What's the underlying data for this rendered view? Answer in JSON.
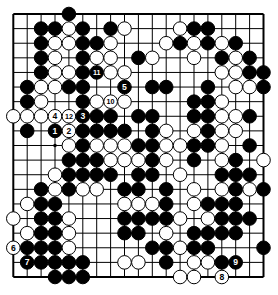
{
  "diagram": {
    "type": "go-board",
    "board_size": 19,
    "colors": {
      "background": "#ffffff",
      "line": "#000000",
      "black_stone": "#000000",
      "white_stone": "#ffffff",
      "black_stone_label": "#ffffff",
      "white_stone_label": "#000000"
    },
    "geometry": {
      "width": 278,
      "height": 295,
      "left": 13.3,
      "top": 14,
      "col_step": 13.9,
      "row_step": 14.611,
      "stone_radius": 6.8
    },
    "star_points": [
      [
        4,
        4
      ],
      [
        10,
        4
      ],
      [
        16,
        4
      ],
      [
        4,
        10
      ],
      [
        10,
        10
      ],
      [
        16,
        10
      ],
      [
        4,
        16
      ],
      [
        10,
        16
      ],
      [
        16,
        16
      ]
    ],
    "stones": [
      [
        5,
        1,
        "b"
      ],
      [
        3,
        2,
        "b"
      ],
      [
        4,
        2,
        "b"
      ],
      [
        5,
        2,
        "w"
      ],
      [
        6,
        2,
        "b"
      ],
      [
        8,
        2,
        "b"
      ],
      [
        9,
        2,
        "w"
      ],
      [
        13,
        2,
        "w"
      ],
      [
        14,
        2,
        "b"
      ],
      [
        15,
        2,
        "b"
      ],
      [
        3,
        3,
        "b"
      ],
      [
        4,
        3,
        "w"
      ],
      [
        5,
        3,
        "w"
      ],
      [
        6,
        3,
        "b"
      ],
      [
        7,
        3,
        "b"
      ],
      [
        8,
        3,
        "w"
      ],
      [
        12,
        3,
        "w"
      ],
      [
        13,
        3,
        "b"
      ],
      [
        14,
        3,
        "w"
      ],
      [
        15,
        3,
        "b"
      ],
      [
        16,
        3,
        "w"
      ],
      [
        17,
        3,
        "b"
      ],
      [
        3,
        4,
        "b"
      ],
      [
        4,
        4,
        "w"
      ],
      [
        6,
        4,
        "b"
      ],
      [
        7,
        4,
        "w"
      ],
      [
        8,
        4,
        "w"
      ],
      [
        10,
        4,
        "b"
      ],
      [
        11,
        4,
        "w"
      ],
      [
        14,
        4,
        "w"
      ],
      [
        16,
        4,
        "b"
      ],
      [
        17,
        4,
        "w"
      ],
      [
        18,
        4,
        "b"
      ],
      [
        3,
        5,
        "b"
      ],
      [
        4,
        5,
        "w"
      ],
      [
        5,
        5,
        "w"
      ],
      [
        6,
        5,
        "b"
      ],
      [
        7,
        5,
        "b",
        11
      ],
      [
        8,
        5,
        "w"
      ],
      [
        9,
        5,
        "w"
      ],
      [
        16,
        5,
        "w"
      ],
      [
        17,
        5,
        "w"
      ],
      [
        18,
        5,
        "b"
      ],
      [
        19,
        5,
        "b"
      ],
      [
        2,
        6,
        "b"
      ],
      [
        3,
        6,
        "w"
      ],
      [
        4,
        6,
        "w"
      ],
      [
        5,
        6,
        "b"
      ],
      [
        6,
        6,
        "b"
      ],
      [
        9,
        6,
        "b",
        5
      ],
      [
        11,
        6,
        "b"
      ],
      [
        12,
        6,
        "b"
      ],
      [
        15,
        6,
        "b"
      ],
      [
        17,
        6,
        "w"
      ],
      [
        18,
        6,
        "w"
      ],
      [
        19,
        6,
        "b"
      ],
      [
        2,
        7,
        "b"
      ],
      [
        3,
        7,
        "w"
      ],
      [
        6,
        7,
        "b"
      ],
      [
        7,
        7,
        "w"
      ],
      [
        8,
        7,
        "w",
        10
      ],
      [
        9,
        7,
        "w"
      ],
      [
        14,
        7,
        "b"
      ],
      [
        15,
        7,
        "b"
      ],
      [
        16,
        7,
        "w"
      ],
      [
        1,
        8,
        "w"
      ],
      [
        2,
        8,
        "w"
      ],
      [
        3,
        8,
        "w"
      ],
      [
        4,
        8,
        "w",
        4
      ],
      [
        5,
        8,
        "w",
        12
      ],
      [
        6,
        8,
        "b",
        3
      ],
      [
        7,
        8,
        "b"
      ],
      [
        8,
        8,
        "b"
      ],
      [
        10,
        8,
        "b"
      ],
      [
        11,
        8,
        "b"
      ],
      [
        14,
        8,
        "b"
      ],
      [
        15,
        8,
        "b"
      ],
      [
        16,
        8,
        "w"
      ],
      [
        17,
        8,
        "w"
      ],
      [
        18,
        8,
        "b"
      ],
      [
        2,
        9,
        "b"
      ],
      [
        4,
        9,
        "b",
        1
      ],
      [
        5,
        9,
        "w",
        2
      ],
      [
        6,
        9,
        "b"
      ],
      [
        7,
        9,
        "b"
      ],
      [
        8,
        9,
        "b"
      ],
      [
        9,
        9,
        "b"
      ],
      [
        11,
        9,
        "b"
      ],
      [
        12,
        9,
        "w"
      ],
      [
        14,
        9,
        "w"
      ],
      [
        15,
        9,
        "b"
      ],
      [
        16,
        9,
        "w"
      ],
      [
        17,
        9,
        "w"
      ],
      [
        5,
        10,
        "w"
      ],
      [
        6,
        10,
        "b"
      ],
      [
        7,
        10,
        "w"
      ],
      [
        8,
        10,
        "w"
      ],
      [
        9,
        10,
        "w"
      ],
      [
        10,
        10,
        "b"
      ],
      [
        11,
        10,
        "b"
      ],
      [
        12,
        10,
        "w"
      ],
      [
        13,
        10,
        "w"
      ],
      [
        14,
        10,
        "b"
      ],
      [
        15,
        10,
        "b"
      ],
      [
        16,
        10,
        "w"
      ],
      [
        18,
        10,
        "b"
      ],
      [
        5,
        11,
        "b"
      ],
      [
        6,
        11,
        "b"
      ],
      [
        7,
        11,
        "b"
      ],
      [
        8,
        11,
        "w"
      ],
      [
        9,
        11,
        "w"
      ],
      [
        10,
        11,
        "w"
      ],
      [
        11,
        11,
        "b"
      ],
      [
        12,
        11,
        "w"
      ],
      [
        14,
        11,
        "b"
      ],
      [
        16,
        11,
        "w"
      ],
      [
        17,
        11,
        "b"
      ],
      [
        19,
        11,
        "w"
      ],
      [
        4,
        12,
        "w"
      ],
      [
        5,
        12,
        "b"
      ],
      [
        6,
        12,
        "b"
      ],
      [
        7,
        12,
        "b"
      ],
      [
        8,
        12,
        "b"
      ],
      [
        10,
        12,
        "b"
      ],
      [
        11,
        12,
        "b"
      ],
      [
        13,
        12,
        "w"
      ],
      [
        16,
        12,
        "b"
      ],
      [
        17,
        12,
        "b"
      ],
      [
        18,
        12,
        "b"
      ],
      [
        3,
        13,
        "b"
      ],
      [
        4,
        13,
        "w"
      ],
      [
        5,
        13,
        "b"
      ],
      [
        6,
        13,
        "w"
      ],
      [
        7,
        13,
        "w"
      ],
      [
        9,
        13,
        "b"
      ],
      [
        10,
        13,
        "b"
      ],
      [
        12,
        13,
        "b"
      ],
      [
        14,
        13,
        "w"
      ],
      [
        16,
        13,
        "w"
      ],
      [
        17,
        13,
        "b"
      ],
      [
        18,
        13,
        "w"
      ],
      [
        19,
        13,
        "b"
      ],
      [
        2,
        14,
        "w"
      ],
      [
        3,
        14,
        "b"
      ],
      [
        4,
        14,
        "b"
      ],
      [
        9,
        14,
        "w"
      ],
      [
        10,
        14,
        "w"
      ],
      [
        11,
        14,
        "w"
      ],
      [
        12,
        14,
        "b"
      ],
      [
        14,
        14,
        "w"
      ],
      [
        15,
        14,
        "b"
      ],
      [
        16,
        14,
        "b"
      ],
      [
        17,
        14,
        "b"
      ],
      [
        1,
        15,
        "w"
      ],
      [
        3,
        15,
        "b"
      ],
      [
        4,
        15,
        "b"
      ],
      [
        5,
        15,
        "w"
      ],
      [
        9,
        15,
        "b"
      ],
      [
        10,
        15,
        "b"
      ],
      [
        11,
        15,
        "b"
      ],
      [
        12,
        15,
        "b"
      ],
      [
        13,
        15,
        "w"
      ],
      [
        15,
        15,
        "w"
      ],
      [
        16,
        15,
        "b"
      ],
      [
        17,
        15,
        "b"
      ],
      [
        18,
        15,
        "b"
      ],
      [
        2,
        16,
        "w"
      ],
      [
        3,
        16,
        "b"
      ],
      [
        4,
        16,
        "b"
      ],
      [
        5,
        16,
        "w"
      ],
      [
        9,
        16,
        "b"
      ],
      [
        10,
        16,
        "b"
      ],
      [
        12,
        16,
        "w"
      ],
      [
        14,
        16,
        "b"
      ],
      [
        15,
        16,
        "b"
      ],
      [
        16,
        16,
        "b"
      ],
      [
        17,
        16,
        "b"
      ],
      [
        1,
        17,
        "w",
        6
      ],
      [
        2,
        17,
        "b"
      ],
      [
        3,
        17,
        "b"
      ],
      [
        4,
        17,
        "b"
      ],
      [
        5,
        17,
        "w"
      ],
      [
        11,
        17,
        "b"
      ],
      [
        12,
        17,
        "b"
      ],
      [
        13,
        17,
        "w"
      ],
      [
        14,
        17,
        "b"
      ],
      [
        15,
        17,
        "b"
      ],
      [
        19,
        17,
        "b"
      ],
      [
        2,
        18,
        "b",
        7
      ],
      [
        3,
        18,
        "b"
      ],
      [
        4,
        18,
        "b"
      ],
      [
        5,
        18,
        "b"
      ],
      [
        6,
        18,
        "b"
      ],
      [
        9,
        18,
        "w"
      ],
      [
        10,
        18,
        "w"
      ],
      [
        12,
        18,
        "b"
      ],
      [
        14,
        18,
        "w"
      ],
      [
        15,
        18,
        "w"
      ],
      [
        16,
        18,
        "b"
      ],
      [
        17,
        18,
        "b",
        9
      ],
      [
        4,
        19,
        "b"
      ],
      [
        5,
        19,
        "b"
      ],
      [
        6,
        19,
        "b"
      ],
      [
        13,
        19,
        "w"
      ],
      [
        14,
        19,
        "w"
      ],
      [
        16,
        19,
        "w",
        8
      ]
    ],
    "move_numbers_shown": [
      "1",
      "2",
      "3",
      "4",
      "5",
      "6",
      "7",
      "8",
      "9",
      "10",
      "11",
      "12"
    ]
  }
}
